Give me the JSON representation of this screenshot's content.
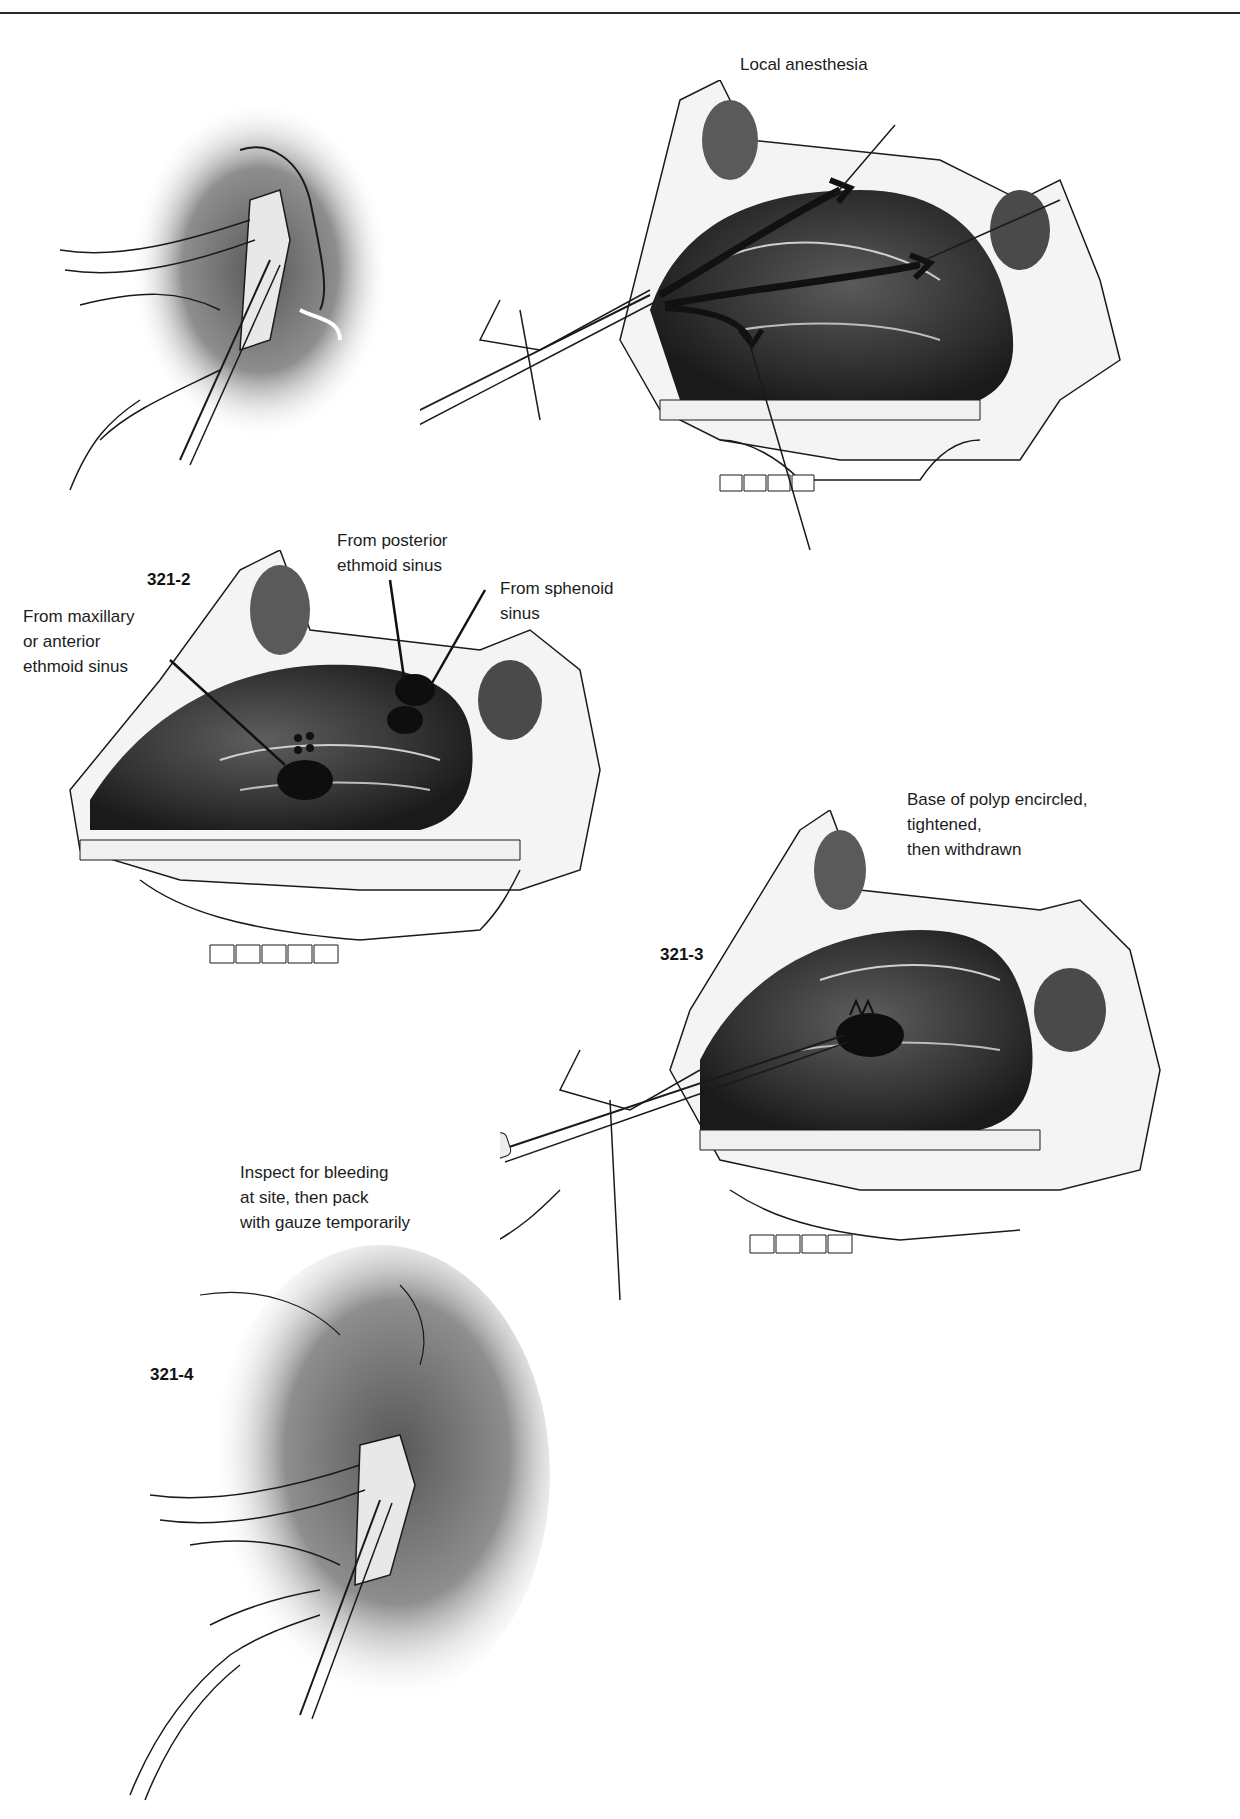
{
  "page": {
    "running_head": "",
    "figures": [
      {
        "id": "321-0",
        "number": "",
        "caption": "",
        "subject": "external nose with nasal speculum and forceps"
      },
      {
        "id": "321-1",
        "number": "321-1",
        "caption": "Local anesthesia",
        "subject": "sagittal section of nasal cavity, anesthesia needle paths"
      },
      {
        "id": "321-2",
        "number": "321-2",
        "caption": "",
        "subject": "sagittal section showing polyp origins",
        "annotations": [
          "From posterior\nethmoid sinus",
          "From sphenoid\nsinus",
          "From maxillary\nor anterior\nethmoid sinus"
        ]
      },
      {
        "id": "321-3",
        "number": "321-3",
        "caption": "Base of polyp encircled,\ntightened,\nthen withdrawn",
        "subject": "snare removal of polyp"
      },
      {
        "id": "321-4",
        "number": "321-4",
        "caption": "Inspect for bleeding\nat site, then pack\nwith gauze temporarily",
        "subject": "external nose with speculum, gauze packing"
      }
    ]
  },
  "colors": {
    "ink": "#1a1a1a",
    "shade_dark": "#3a3a3a",
    "shade_mid": "#8a8a8a",
    "shade_light": "#cfcfcf",
    "paper": "#ffffff"
  }
}
